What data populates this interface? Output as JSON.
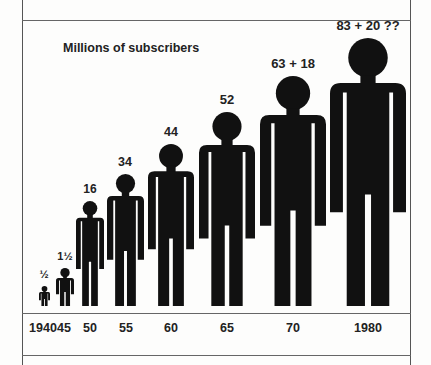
{
  "chart_data": {
    "type": "bar",
    "style": "pictogram (human figures scaled by value)",
    "title": "Millions of subscribers",
    "xlabel": "",
    "ylabel": "Millions of subscribers",
    "categories": [
      "1940",
      "45",
      "50",
      "55",
      "60",
      "65",
      "70",
      "1980"
    ],
    "value_labels": [
      "½",
      "1½",
      "16",
      "34",
      "44",
      "52",
      "63 + 18",
      "83 + 20 ??"
    ],
    "values": [
      0.5,
      1.5,
      16,
      34,
      44,
      52,
      81,
      103
    ],
    "series": [
      {
        "name": "Subscribers",
        "values": [
          0.5,
          1.5,
          16,
          34,
          44,
          52,
          63,
          83
        ]
      },
      {
        "name": "Additional",
        "values": [
          0,
          0,
          0,
          0,
          0,
          0,
          18,
          20
        ]
      }
    ],
    "annotations": [
      "1980 value marked uncertain (??)"
    ],
    "grid": false,
    "legend": "none"
  },
  "figures": [
    {
      "year": "1940",
      "label": "½",
      "cx": 44,
      "w": 11,
      "h": 20,
      "fs": 11
    },
    {
      "year": "45",
      "label": "1½",
      "cx": 65,
      "w": 18,
      "h": 38,
      "fs": 11
    },
    {
      "year": "50",
      "label": "16",
      "cx": 90,
      "w": 28,
      "h": 105,
      "fs": 12
    },
    {
      "year": "55",
      "label": "34",
      "cx": 125,
      "w": 37,
      "h": 132,
      "fs": 12.5
    },
    {
      "year": "60",
      "label": "44",
      "cx": 171,
      "w": 46,
      "h": 162,
      "fs": 12.5
    },
    {
      "year": "65",
      "label": "52",
      "cx": 227,
      "w": 56,
      "h": 194,
      "fs": 13
    },
    {
      "year": "70",
      "label": "63 + 18",
      "cx": 293,
      "w": 66,
      "h": 230,
      "fs": 13
    },
    {
      "year": "1980",
      "label": "83 + 20 ??",
      "cx": 368,
      "w": 76,
      "h": 268,
      "fs": 13
    }
  ],
  "xaxis": {
    "labels": [
      {
        "text": "1940",
        "x": 43
      },
      {
        "text": "45",
        "x": 64
      },
      {
        "text": "50",
        "x": 90
      },
      {
        "text": "55",
        "x": 126
      },
      {
        "text": "60",
        "x": 171
      },
      {
        "text": "65",
        "x": 227
      },
      {
        "text": "70",
        "x": 293
      },
      {
        "text": "1980",
        "x": 368
      }
    ]
  },
  "colors": {
    "figure": "#111111",
    "background": "#fdfdfc",
    "rule": "#666666"
  }
}
